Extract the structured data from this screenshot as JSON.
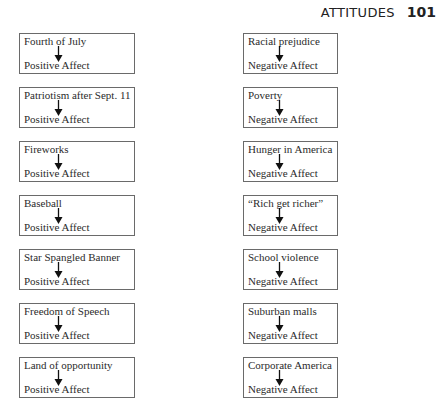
{
  "header": {
    "title": "ATTITUDES",
    "page_number": "101"
  },
  "left_column": [
    {
      "cue": "Fourth of July",
      "affect": "Positive Affect"
    },
    {
      "cue": "Patriotism after Sept. 11",
      "affect": "Positive Affect"
    },
    {
      "cue": "Fireworks",
      "affect": "Positive Affect"
    },
    {
      "cue": "Baseball",
      "affect": "Positive Affect"
    },
    {
      "cue": "Star Spangled Banner",
      "affect": "Positive Affect"
    },
    {
      "cue": "Freedom of Speech",
      "affect": "Positive Affect"
    },
    {
      "cue": "Land of opportunity",
      "affect": "Positive Affect"
    }
  ],
  "right_column": [
    {
      "cue": "Racial prejudice",
      "affect": "Negative Affect"
    },
    {
      "cue": "Poverty",
      "affect": "Negative Affect"
    },
    {
      "cue": "Hunger in America",
      "affect": "Negative Affect"
    },
    {
      "cue": "“Rich get richer”",
      "affect": "Negative Affect"
    },
    {
      "cue": "School violence",
      "affect": "Negative Affect"
    },
    {
      "cue": "Suburban malls",
      "affect": "Negative Affect"
    },
    {
      "cue": "Corporate America",
      "affect": "Negative Affect"
    }
  ],
  "icons": {
    "arrow": "down-arrow-icon"
  }
}
